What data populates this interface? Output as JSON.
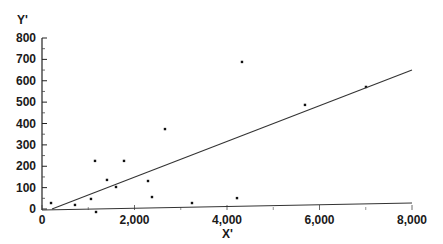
{
  "chart_data": {
    "type": "scatter",
    "title": "",
    "xlabel": "X'",
    "ylabel": "Y'",
    "xlim": [
      0,
      8000
    ],
    "ylim": [
      0,
      800
    ],
    "grid": false,
    "legend": null,
    "x_ticks": [
      0,
      2000,
      4000,
      6000,
      8000
    ],
    "x_tick_labels": [
      "0",
      "2,000",
      "4,000",
      "6,000",
      "8,000"
    ],
    "y_ticks": [
      0,
      100,
      200,
      300,
      400,
      500,
      600,
      700,
      800
    ],
    "y_tick_labels": [
      "0",
      "100",
      "200",
      "300",
      "400",
      "500",
      "600",
      "700",
      "800"
    ],
    "series": [
      {
        "name": "observations",
        "kind": "points",
        "x": [
          195,
          713,
          1059,
          1146,
          1168,
          1405,
          1600,
          1773,
          2292,
          2378,
          2659,
          3243,
          4216,
          4324,
          5686,
          7005
        ],
        "y": [
          28,
          19,
          47,
          225,
          -14,
          136,
          103,
          225,
          131,
          56,
          374,
          28,
          51,
          688,
          487,
          571
        ]
      },
      {
        "name": "fit-line-steep",
        "kind": "line",
        "x": [
          216,
          8000
        ],
        "y": [
          0,
          650
        ]
      },
      {
        "name": "fit-line-flat",
        "kind": "line",
        "x": [
          0,
          8000
        ],
        "y": [
          -5,
          28
        ]
      }
    ]
  },
  "labels": {
    "y_axis_title": "Y'",
    "x_axis_title": "X'"
  }
}
